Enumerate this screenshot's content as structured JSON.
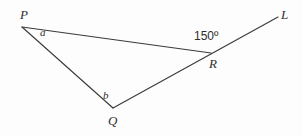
{
  "figure": {
    "type": "geometry-diagram",
    "stroke_color": "#3b3b3b",
    "background_color": "#fdfdfd",
    "text_color": "#2e2e2e",
    "points": {
      "P": {
        "label": "P",
        "x": 22,
        "y": 27
      },
      "Q": {
        "label": "Q",
        "x": 113,
        "y": 108
      },
      "R": {
        "label": "R",
        "x": 211,
        "y": 53
      },
      "L": {
        "label": "L",
        "x": 278,
        "y": 17
      }
    },
    "segments": [
      {
        "name": "segment-PR",
        "from": "P",
        "to": "R"
      },
      {
        "name": "segment-PQ",
        "from": "P",
        "to": "Q"
      },
      {
        "name": "segment-QL",
        "from": "Q",
        "to": "L"
      }
    ],
    "angles": {
      "at_P": {
        "label": "a",
        "x": 44,
        "y": 33
      },
      "at_Q": {
        "label": "b",
        "x": 107,
        "y": 96
      },
      "exterior_at_R": {
        "label": "150º",
        "value": 150,
        "unit": "degrees",
        "x": 212,
        "y": 37
      }
    }
  }
}
